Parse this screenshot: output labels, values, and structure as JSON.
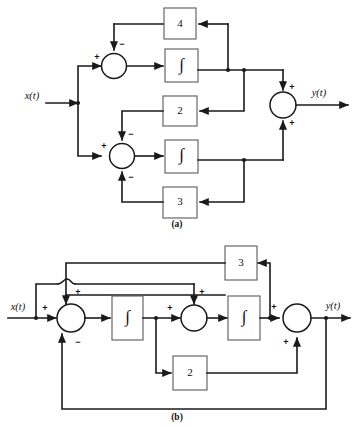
{
  "figure": {
    "background_color": "#ffffff",
    "line_color": "#1a1a1a",
    "box_stroke_color": "#5a5a5a"
  },
  "diagram_a": {
    "caption": "(a)",
    "input_label": "x(t)",
    "output_label": "y(t)",
    "blocks": [
      {
        "id": "a-gain-4",
        "label": "4",
        "type": "gain"
      },
      {
        "id": "a-integ-top",
        "label": "∫",
        "type": "integrator"
      },
      {
        "id": "a-gain-2",
        "label": "2",
        "type": "gain"
      },
      {
        "id": "a-integ-bottom",
        "label": "∫",
        "type": "integrator"
      },
      {
        "id": "a-gain-3",
        "label": "3",
        "type": "gain"
      }
    ],
    "summers": [
      {
        "id": "a-sum-top",
        "signs": {
          "left": "+",
          "top": "−"
        }
      },
      {
        "id": "a-sum-bottom",
        "signs": {
          "left": "+",
          "top": "−",
          "bottom": "−"
        }
      },
      {
        "id": "a-sum-out",
        "signs": {
          "top": "+",
          "bottom": "+"
        }
      }
    ]
  },
  "diagram_b": {
    "caption": "(b)",
    "input_label": "x(t)",
    "output_label": "y(t)",
    "blocks": [
      {
        "id": "b-gain-3",
        "label": "3",
        "type": "gain"
      },
      {
        "id": "b-integ-left",
        "label": "∫",
        "type": "integrator"
      },
      {
        "id": "b-integ-right",
        "label": "∫",
        "type": "integrator"
      },
      {
        "id": "b-gain-2",
        "label": "2",
        "type": "gain"
      }
    ],
    "summers": [
      {
        "id": "b-sum-1",
        "signs": {
          "left": "+",
          "top": "+",
          "bottom": "−"
        }
      },
      {
        "id": "b-sum-2",
        "signs": {
          "left": "+",
          "top": "+"
        }
      },
      {
        "id": "b-sum-3",
        "signs": {
          "left": "+",
          "bottom": "+"
        }
      }
    ]
  },
  "signs": {
    "plus": "+",
    "minus": "−"
  }
}
